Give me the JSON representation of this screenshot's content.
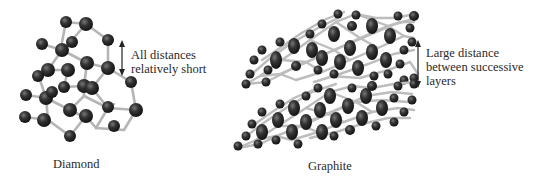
{
  "figure": {
    "panels": [
      {
        "id": "diamond",
        "caption": "Diamond",
        "annotation": {
          "lines": [
            "All distances",
            "relatively short"
          ],
          "arrow": "double-vertical-arrow"
        }
      },
      {
        "id": "graphite",
        "caption": "Graphite",
        "annotation": {
          "lines": [
            "Large distance",
            "between successive",
            "layers"
          ],
          "arrow": "double-vertical-arrow"
        }
      }
    ],
    "colors": {
      "atom_dark": "#1e1e1e",
      "atom_highlight": "#6a6a6a",
      "bond": "#b8b8b8",
      "text": "#2a2a2a",
      "background": "#ffffff"
    }
  }
}
